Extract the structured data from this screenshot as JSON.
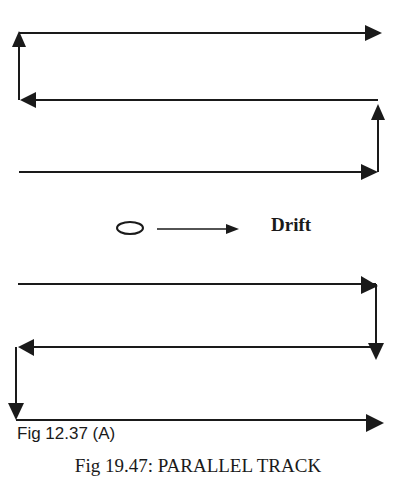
{
  "diagram": {
    "title": "Fig 19.47: PARALLEL TRACK",
    "subcaption": "Fig 12.37 (A)",
    "drift_label": "Drift",
    "pattern": "parallel track search",
    "colors": {
      "line": "#1a1a1a",
      "background": "#ffffff"
    },
    "legend": {
      "object_icon": "ellipse-icon",
      "arrow_icon": "arrow-right-icon",
      "label": "Drift"
    },
    "upper_tracks": [
      {
        "y": 33,
        "direction": "right"
      },
      {
        "y": 100,
        "direction": "left"
      },
      {
        "y": 172,
        "direction": "right"
      }
    ],
    "lower_tracks": [
      {
        "y": 284,
        "direction": "right"
      },
      {
        "y": 347,
        "direction": "left"
      },
      {
        "y": 420,
        "direction": "right"
      }
    ]
  }
}
